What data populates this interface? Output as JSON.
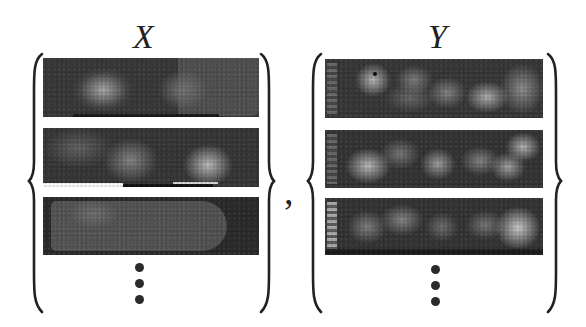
{
  "figure": {
    "left_set": {
      "label": "X",
      "panels": [
        {
          "id": "x1",
          "description": "dark thermal-style image, bright spots at left and center, rounded shape at right"
        },
        {
          "id": "x2",
          "description": "dark image with three bright spots, bright band along bottom edge"
        },
        {
          "id": "x3",
          "description": "dark image with rounded elongated grey shape"
        }
      ],
      "ellipsis": "⋮",
      "brace": "curly"
    },
    "separator": ",",
    "right_set": {
      "label": "Y",
      "panels": [
        {
          "id": "y1",
          "description": "dark image with multiple bright blurry spots in a row, label strip on left"
        },
        {
          "id": "y2",
          "description": "dark image with multiple bright blurry spots, label strip on left"
        },
        {
          "id": "y3",
          "description": "dark image with multiple bright blurry spots, label strip on left"
        }
      ],
      "ellipsis": "⋮",
      "brace": "curly"
    },
    "colors": {
      "ink": "#222222",
      "panel_bg": "#3a3a3a",
      "highlight": "#c8c8c8"
    }
  }
}
